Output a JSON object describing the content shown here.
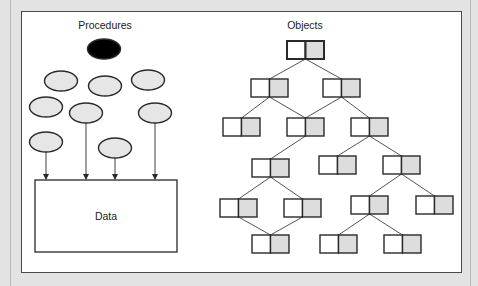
{
  "figure": {
    "colors": {
      "background": "#e3e3e3",
      "panel": "#ffffff",
      "stroke": "#2a2a2a",
      "ellipse_fill": "#e6e6e6",
      "ellipse_active_fill": "#000000",
      "object_left_fill": "#ffffff",
      "object_right_fill": "#dddddd"
    }
  },
  "procedures": {
    "title": "Procedures",
    "title_pos": [
      105,
      29
    ],
    "ellipses": [
      {
        "cx": 104,
        "cy": 49,
        "active": true
      },
      {
        "cx": 61,
        "cy": 81,
        "active": false
      },
      {
        "cx": 105,
        "cy": 86,
        "active": false
      },
      {
        "cx": 148,
        "cy": 80,
        "active": false
      },
      {
        "cx": 46,
        "cy": 107,
        "active": false
      },
      {
        "cx": 86,
        "cy": 113,
        "active": false
      },
      {
        "cx": 155,
        "cy": 113,
        "active": false
      },
      {
        "cx": 46,
        "cy": 142,
        "active": false
      },
      {
        "cx": 115,
        "cy": 148,
        "active": false
      }
    ],
    "ellipse_rx": 16.5,
    "ellipse_ry": 10,
    "arrows": [
      {
        "x": 46,
        "y1": 152,
        "y2": 180
      },
      {
        "x": 86,
        "y1": 123,
        "y2": 180
      },
      {
        "x": 115,
        "y1": 158,
        "y2": 180
      },
      {
        "x": 155,
        "y1": 123,
        "y2": 180
      }
    ],
    "data_box": {
      "label": "Data",
      "x": 35,
      "y": 180,
      "w": 142,
      "h": 72
    }
  },
  "objects": {
    "title": "Objects",
    "title_pos": [
      305,
      29
    ],
    "box_w": 37,
    "box_h": 18,
    "nodes": [
      {
        "id": "root",
        "x": 287,
        "y": 41,
        "emphasis": true
      },
      {
        "id": "l2a",
        "x": 251,
        "y": 79
      },
      {
        "id": "l2b",
        "x": 323,
        "y": 79
      },
      {
        "id": "l3a",
        "x": 223,
        "y": 118
      },
      {
        "id": "l3b",
        "x": 287,
        "y": 118
      },
      {
        "id": "l3c",
        "x": 351,
        "y": 118
      },
      {
        "id": "l4a",
        "x": 252,
        "y": 159
      },
      {
        "id": "l4b",
        "x": 319,
        "y": 156
      },
      {
        "id": "l4c",
        "x": 383,
        "y": 156
      },
      {
        "id": "l5a",
        "x": 220,
        "y": 199
      },
      {
        "id": "l5b",
        "x": 284,
        "y": 199
      },
      {
        "id": "l5c",
        "x": 351,
        "y": 196
      },
      {
        "id": "l5d",
        "x": 416,
        "y": 196
      },
      {
        "id": "l6a",
        "x": 252,
        "y": 235
      },
      {
        "id": "l6b",
        "x": 320,
        "y": 235
      },
      {
        "id": "l6c",
        "x": 384,
        "y": 235
      }
    ],
    "edges": [
      [
        "root",
        "l2a"
      ],
      [
        "root",
        "l2b"
      ],
      [
        "l2a",
        "l3a"
      ],
      [
        "l2a",
        "l3b"
      ],
      [
        "l2b",
        "l3b"
      ],
      [
        "l2b",
        "l3c"
      ],
      [
        "l3b",
        "l4a"
      ],
      [
        "l3c",
        "l4b"
      ],
      [
        "l3c",
        "l4c"
      ],
      [
        "l4a",
        "l5a"
      ],
      [
        "l4a",
        "l5b"
      ],
      [
        "l4c",
        "l5c"
      ],
      [
        "l4c",
        "l5d"
      ],
      [
        "l5a",
        "l6a"
      ],
      [
        "l5b",
        "l6a"
      ],
      [
        "l5c",
        "l6b"
      ],
      [
        "l5c",
        "l6c"
      ]
    ]
  }
}
